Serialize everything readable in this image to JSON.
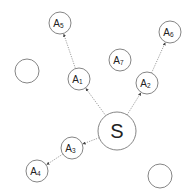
{
  "diagram": {
    "title": "",
    "source_node": {
      "id": "S",
      "label": "S",
      "cx": 117,
      "cy": 131,
      "r": 19
    },
    "nodes": [
      {
        "id": "A1",
        "base": "A",
        "sub": "1",
        "cx": 79,
        "cy": 79,
        "r": 11
      },
      {
        "id": "A2",
        "base": "A",
        "sub": "2",
        "cx": 147,
        "cy": 83,
        "r": 11
      },
      {
        "id": "A3",
        "base": "A",
        "sub": "3",
        "cx": 72,
        "cy": 148,
        "r": 11
      },
      {
        "id": "A4",
        "base": "A",
        "sub": "4",
        "cx": 37,
        "cy": 171,
        "r": 11
      },
      {
        "id": "A5",
        "base": "A",
        "sub": "5",
        "cx": 60,
        "cy": 23,
        "r": 11
      },
      {
        "id": "A6",
        "base": "A",
        "sub": "6",
        "cx": 170,
        "cy": 32,
        "r": 11
      },
      {
        "id": "A7",
        "base": "A",
        "sub": "7",
        "cx": 120,
        "cy": 60,
        "r": 11
      }
    ],
    "empty_nodes": [
      {
        "id": "empty-left",
        "cx": 27,
        "cy": 71,
        "r": 12
      },
      {
        "id": "empty-bottom-right",
        "cx": 160,
        "cy": 176,
        "r": 12
      }
    ],
    "edges": [
      {
        "from": "S",
        "to": "A1",
        "style": "dotted-arrow"
      },
      {
        "from": "S",
        "to": "A2",
        "style": "dotted-arrow"
      },
      {
        "from": "S",
        "to": "A3",
        "style": "dotted-arrow"
      },
      {
        "from": "A1",
        "to": "A5",
        "style": "dotted-arrow"
      },
      {
        "from": "A2",
        "to": "A6",
        "style": "dotted-arrow"
      },
      {
        "from": "A3",
        "to": "A4",
        "style": "dotted-arrow"
      }
    ],
    "colors": {
      "stroke": "#777777",
      "edge": "#888888",
      "text": "#222222",
      "background": "#ffffff"
    }
  }
}
